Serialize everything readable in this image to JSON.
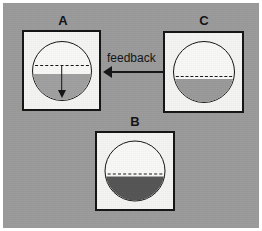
{
  "figure": {
    "background_color": "#9b9b9b",
    "panel_background": "#f4f4f2",
    "ink_color": "#141414"
  },
  "panels": [
    {
      "id": "A",
      "label": "A",
      "vessel": {
        "fill_level_pct": 48,
        "fill_color": "#a0a0a0",
        "setpoint_level_pct": 58,
        "setpoint_style": "dashed",
        "hatched": false
      },
      "annotation": {
        "arrow": "down-arrow",
        "meaning": "level falling toward set point"
      }
    },
    {
      "id": "B",
      "label": "B",
      "vessel": {
        "fill_level_pct": 44,
        "fill_color": "#555555",
        "setpoint_level_pct": 44,
        "setpoint_style": "dashed",
        "hatched": false
      },
      "annotation": null
    },
    {
      "id": "C",
      "label": "C",
      "vessel": {
        "fill_level_pct": 42,
        "fill_color": "#9a9a9a",
        "setpoint_level_pct": 42,
        "setpoint_style": "dashed",
        "hatched": true
      },
      "annotation": null
    }
  ],
  "connector": {
    "label": "feedback",
    "direction": "left",
    "from_panel": "C",
    "to_panel": "A"
  }
}
